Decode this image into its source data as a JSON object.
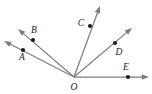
{
  "figure": {
    "kind": "geometry-diagram",
    "width": 152,
    "height": 94,
    "background_color": "#ffffff",
    "line_color": "#7d7d7d",
    "dot_color": "#1c1c1c",
    "label_color": "#1c1c1c",
    "vertex": {
      "name": "O",
      "label": "O",
      "x": 74,
      "y": 77,
      "label_x": 74,
      "label_y": 88
    },
    "rays": [
      {
        "name": "ray-OA",
        "label": "A",
        "label_x": 22,
        "label_y": 58,
        "dot_x": 23,
        "dot_y": 50,
        "tip_x": 4,
        "tip_y": 41,
        "angle_deg": 151
      },
      {
        "name": "ray-OB",
        "label": "B",
        "label_x": 34,
        "label_y": 31,
        "dot_x": 33,
        "dot_y": 40,
        "tip_x": 18,
        "tip_y": 29,
        "angle_deg": 140
      },
      {
        "name": "ray-OC",
        "label": "C",
        "label_x": 81,
        "label_y": 24,
        "dot_x": 90,
        "dot_y": 26,
        "tip_x": 100,
        "tip_y": 6,
        "angle_deg": 70
      },
      {
        "name": "ray-OD",
        "label": "D",
        "label_x": 119,
        "label_y": 53,
        "dot_x": 115,
        "dot_y": 43,
        "tip_x": 132,
        "tip_y": 28,
        "angle_deg": 45
      },
      {
        "name": "ray-OE",
        "label": "E",
        "label_x": 126,
        "label_y": 68,
        "dot_x": 128,
        "dot_y": 77,
        "tip_x": 149,
        "tip_y": 77,
        "angle_deg": 0
      }
    ]
  }
}
